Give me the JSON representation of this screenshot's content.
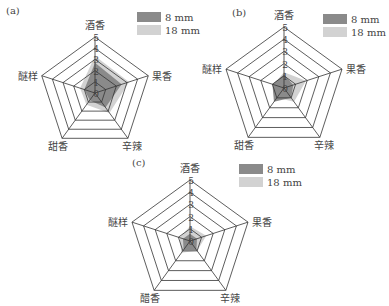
{
  "legend": {
    "series": [
      {
        "name": "8 mm",
        "color": "#8a8a8a"
      },
      {
        "name": "18 mm",
        "color": "#d2d2d2"
      }
    ]
  },
  "chart_data": [
    {
      "type": "radar",
      "panel_label": "(a)",
      "categories": [
        "酒香",
        "果香",
        "辛辣",
        "甜香",
        "醚样"
      ],
      "scale_ticks": [
        "0",
        "1",
        "2",
        "3",
        "4",
        "5"
      ],
      "range": [
        0,
        5
      ],
      "series": [
        {
          "name": "8 mm",
          "values": [
            2.7,
            2.5,
            1.6,
            0.8,
            1.0
          ]
        },
        {
          "name": "18 mm",
          "values": [
            3.3,
            3.2,
            2.2,
            1.3,
            1.4
          ]
        }
      ]
    },
    {
      "type": "radar",
      "panel_label": "(b)",
      "categories": [
        "酒香",
        "果香",
        "辛辣",
        "甜香",
        "醚样"
      ],
      "scale_ticks": [
        "0",
        "1",
        "2",
        "3",
        "4",
        "5"
      ],
      "range": [
        0,
        5
      ],
      "series": [
        {
          "name": "8 mm",
          "values": [
            1.1,
            0.8,
            1.0,
            1.4,
            1.0
          ]
        },
        {
          "name": "18 mm",
          "values": [
            1.3,
            1.9,
            1.4,
            1.0,
            0.9
          ]
        }
      ]
    },
    {
      "type": "radar",
      "panel_label": "(c)",
      "categories": [
        "酒香",
        "果香",
        "辛辣",
        "醋香",
        "醚样"
      ],
      "scale_ticks": [
        "0",
        "1",
        "2",
        "3",
        "4",
        "5"
      ],
      "range": [
        0,
        5
      ],
      "series": [
        {
          "name": "8 mm",
          "values": [
            0.6,
            0.6,
            0.9,
            0.9,
            0.6
          ]
        },
        {
          "name": "18 mm",
          "values": [
            1.2,
            1.4,
            1.0,
            1.2,
            0.9
          ]
        }
      ]
    }
  ],
  "layout": {
    "panels": [
      {
        "cx": 95,
        "cy": 93,
        "r": 56,
        "label_x": 6,
        "label_y": 14,
        "legend_x": 137,
        "legend_y": 12
      },
      {
        "cx": 284,
        "cy": 88,
        "r": 61,
        "label_x": 232,
        "label_y": 16,
        "legend_x": 323,
        "legend_y": 14
      },
      {
        "cx": 190,
        "cy": 241,
        "r": 61,
        "label_x": 132,
        "label_y": 166,
        "legend_x": 239,
        "legend_y": 164
      }
    ]
  }
}
